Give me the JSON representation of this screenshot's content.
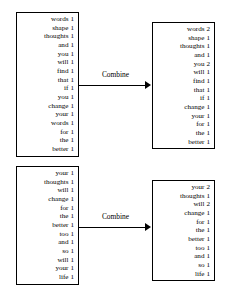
{
  "diagram": {
    "boxes": {
      "top_left": {
        "name": "input-word-counts-top",
        "rows": [
          {
            "word": "words",
            "count": "1"
          },
          {
            "word": "shape",
            "count": "1"
          },
          {
            "word": "thoughts",
            "count": "1"
          },
          {
            "word": "and",
            "count": "1"
          },
          {
            "word": "you",
            "count": "1"
          },
          {
            "word": "will",
            "count": "1"
          },
          {
            "word": "find",
            "count": "1"
          },
          {
            "word": "that",
            "count": "1"
          },
          {
            "word": "if",
            "count": "1"
          },
          {
            "word": "you",
            "count": "1"
          },
          {
            "word": "change",
            "count": "1"
          },
          {
            "word": "your",
            "count": "1"
          },
          {
            "word": "words",
            "count": "1"
          },
          {
            "word": "for",
            "count": "1"
          },
          {
            "word": "the",
            "count": "1"
          },
          {
            "word": "better",
            "count": "1"
          }
        ]
      },
      "top_right": {
        "name": "combined-word-counts-top",
        "rows": [
          {
            "word": "words",
            "count": "2"
          },
          {
            "word": "shape",
            "count": "1"
          },
          {
            "word": "thoughts",
            "count": "1"
          },
          {
            "word": "and",
            "count": "1"
          },
          {
            "word": "you",
            "count": "2"
          },
          {
            "word": "will",
            "count": "1"
          },
          {
            "word": "find",
            "count": "1"
          },
          {
            "word": "that",
            "count": "1"
          },
          {
            "word": "if",
            "count": "1"
          },
          {
            "word": "change",
            "count": "1"
          },
          {
            "word": "your",
            "count": "1"
          },
          {
            "word": "for",
            "count": "1"
          },
          {
            "word": "the",
            "count": "1"
          },
          {
            "word": "better",
            "count": "1"
          }
        ]
      },
      "bottom_left": {
        "name": "input-word-counts-bottom",
        "rows": [
          {
            "word": "your",
            "count": "1"
          },
          {
            "word": "thoughts",
            "count": "1"
          },
          {
            "word": "will",
            "count": "1"
          },
          {
            "word": "change",
            "count": "1"
          },
          {
            "word": "for",
            "count": "1"
          },
          {
            "word": "the",
            "count": "1"
          },
          {
            "word": "better",
            "count": "1"
          },
          {
            "word": "too",
            "count": "1"
          },
          {
            "word": "and",
            "count": "1"
          },
          {
            "word": "so",
            "count": "1"
          },
          {
            "word": "will",
            "count": "1"
          },
          {
            "word": "your",
            "count": "1"
          },
          {
            "word": "life",
            "count": "1"
          }
        ]
      },
      "bottom_right": {
        "name": "combined-word-counts-bottom",
        "rows": [
          {
            "word": "your",
            "count": "2"
          },
          {
            "word": "thoughts",
            "count": "1"
          },
          {
            "word": "will",
            "count": "2"
          },
          {
            "word": "change",
            "count": "1"
          },
          {
            "word": "for",
            "count": "1"
          },
          {
            "word": "the",
            "count": "1"
          },
          {
            "word": "better",
            "count": "1"
          },
          {
            "word": "too",
            "count": "1"
          },
          {
            "word": "and",
            "count": "1"
          },
          {
            "word": "so",
            "count": "1"
          },
          {
            "word": "life",
            "count": "1"
          }
        ]
      }
    },
    "arrows": {
      "top": {
        "label": "Combine"
      },
      "bottom": {
        "label": "Combine"
      }
    },
    "colors": {
      "stroke": "#000000",
      "background": "#ffffff",
      "text": "#000000"
    }
  }
}
